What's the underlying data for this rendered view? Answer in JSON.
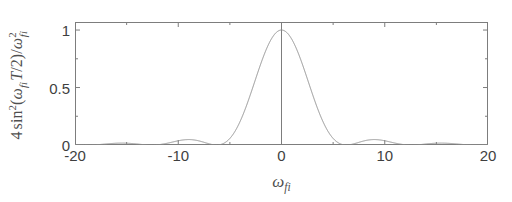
{
  "figure": {
    "background_color": "#ffffff",
    "axis_color": "#7d7d7d",
    "curve_color": "#8f8f8f",
    "text_color": "#4a4a4a"
  },
  "axis_labels": {
    "y_plain": "4 sin^2(omega_fi T/2) / omega_fi^2",
    "x_plain": "omega_fi",
    "y_parts": {
      "coefficient": "4",
      "func": "sin",
      "func_exponent": "2",
      "open_paren": "(",
      "omega1": "ω",
      "omega1_sub": "fi",
      "period": "T",
      "slash_two": "/2",
      "close_paren": ")",
      "divider": "/",
      "omega2": "ω",
      "omega2_exponent": "2",
      "omega2_sub": "fi"
    },
    "x_parts": {
      "omega": "ω",
      "omega_sub": "fi"
    }
  },
  "chart_data": {
    "type": "line",
    "title": "",
    "subtitle": "",
    "xlabel": "ω_fi",
    "ylabel": "4 sin²(ω_fi T/2)/ω²_fi",
    "grid": false,
    "legend": null,
    "xlim": [
      -20,
      20
    ],
    "ylim": [
      0,
      1.07
    ],
    "xticks": [
      -20,
      -10,
      0,
      10,
      20
    ],
    "xtick_labels": [
      "-20",
      "-10",
      "0",
      "10",
      "20"
    ],
    "xticks_minor": [
      -15,
      -5,
      5,
      15
    ],
    "yticks": [
      0,
      0.5,
      1
    ],
    "ytick_labels": [
      "0",
      "0.5",
      "1"
    ],
    "yticks_minor": [
      0.25,
      0.75
    ],
    "annotations": [
      {
        "name": "zero-axis-vertical-line",
        "x": 0,
        "y_from": 0,
        "y_to": 1.07
      }
    ],
    "function": "4*sin(w*T/2)^2/w^2 normalized to peak 1, T = 1",
    "period_T": 1,
    "peak_value": 1.0,
    "peak_x": 0,
    "main_lobe_zeros": [
      -6.283,
      6.283
    ],
    "series": [
      {
        "name": "sinc-squared",
        "color": "#8f8f8f",
        "x": [
          -20,
          -19.5,
          -19,
          -18.5,
          -18,
          -17.5,
          -17,
          -16.5,
          -16,
          -15.5,
          -15,
          -14.5,
          -14,
          -13.5,
          -13,
          -12.5,
          -12,
          -11.5,
          -11,
          -10.5,
          -10,
          -9.5,
          -9,
          -8.5,
          -8,
          -7.5,
          -7,
          -6.5,
          -6,
          -5.5,
          -5,
          -4.5,
          -4,
          -3.5,
          -3,
          -2.5,
          -2,
          -1.5,
          -1,
          -0.5,
          0,
          0.5,
          1,
          1.5,
          2,
          2.5,
          3,
          3.5,
          4,
          4.5,
          5,
          5.5,
          6,
          6.5,
          7,
          7.5,
          8,
          8.5,
          9,
          9.5,
          10,
          10.5,
          11,
          11.5,
          12,
          12.5,
          13,
          13.5,
          14,
          14.5,
          15,
          15.5,
          16,
          16.5,
          17,
          17.5,
          18,
          18.5,
          19,
          19.5,
          20
        ],
        "y": [
          0.0021,
          0.0008,
          0.0,
          0.0,
          0.0008,
          0.002,
          0.0034,
          0.0044,
          0.0049,
          0.0046,
          0.0038,
          0.0026,
          0.0013,
          0.0004,
          0.0,
          0.0002,
          0.0011,
          0.0026,
          0.0045,
          0.0064,
          0.0079,
          0.0085,
          0.0081,
          0.0068,
          0.0047,
          0.0024,
          0.0006,
          0.0,
          0.001,
          0.0039,
          0.0086,
          0.0148,
          0.0216,
          0.028,
          0.0331,
          0.0359,
          0.0364,
          0.0342,
          0.0298,
          0.0241,
          1.0,
          0.9793,
          0.9194,
          0.8269,
          0.7081,
          0.5726,
          0.4317,
          0.298,
          0.1839,
          0.0993,
          0.0453,
          0.016,
          0.0035,
          0.0002,
          0.0013,
          0.006,
          0.0121,
          0.0175,
          0.0207,
          0.021,
          0.0186,
          0.0143,
          0.0094,
          0.0049,
          0.0018,
          0.0002,
          0.0001,
          0.0013,
          0.0034,
          0.0056,
          0.0074,
          0.0082,
          0.0079,
          0.0066,
          0.0047,
          0.0028,
          0.0012,
          0.0002,
          0.0,
          0.0005,
          0.0014
        ],
        "side_lobes": [
          {
            "x": -15.5,
            "peak": 0.016
          },
          {
            "x": -9.3,
            "peak": 0.045
          },
          {
            "x": 9.3,
            "peak": 0.045
          },
          {
            "x": 15.5,
            "peak": 0.016
          }
        ]
      }
    ]
  }
}
